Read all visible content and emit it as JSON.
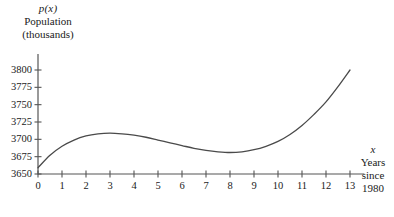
{
  "axes": {
    "y_title_fn": "p(x)",
    "y_title_line1": "Population",
    "y_title_line2": "(thousands)",
    "x_title_fn": "x",
    "x_title_line1": "Years",
    "x_title_line2": "since",
    "x_title_line3": "1980"
  },
  "y_ticks": [
    "3650",
    "3675",
    "3700",
    "3725",
    "3750",
    "3775",
    "3800"
  ],
  "x_ticks": [
    "0",
    "1",
    "2",
    "3",
    "4",
    "5",
    "6",
    "7",
    "8",
    "9",
    "10",
    "11",
    "12",
    "13"
  ],
  "colors": {
    "background": "#ffffff",
    "axis": "#555555",
    "curve": "#4a4a4a",
    "text": "#1a1a1a"
  },
  "chart_data": {
    "type": "line",
    "title": "",
    "xlabel": "Years since 1980",
    "ylabel": "Population (thousands)",
    "xlim": [
      0,
      13.6
    ],
    "ylim": [
      3650,
      3805
    ],
    "grid": false,
    "legend": null,
    "x_tick_values": [
      0,
      1,
      2,
      3,
      4,
      5,
      6,
      7,
      8,
      9,
      10,
      11,
      12,
      13
    ],
    "y_tick_values": [
      3650,
      3675,
      3700,
      3725,
      3750,
      3775,
      3800
    ],
    "annotations": [],
    "series": [
      {
        "name": "p(x)",
        "x": [
          0,
          0.5,
          1,
          1.5,
          2,
          2.5,
          3,
          3.5,
          4,
          4.5,
          5,
          5.5,
          6,
          6.5,
          7,
          7.5,
          8,
          8.5,
          9,
          9.5,
          10,
          10.5,
          11,
          11.5,
          12,
          12.5,
          13
        ],
        "values": [
          3659,
          3677,
          3690,
          3699,
          3705,
          3708,
          3709,
          3708,
          3706,
          3703,
          3699,
          3695,
          3691,
          3687,
          3684,
          3682,
          3681,
          3682,
          3685,
          3690,
          3697,
          3707,
          3720,
          3736,
          3754,
          3776,
          3800
        ]
      }
    ]
  }
}
